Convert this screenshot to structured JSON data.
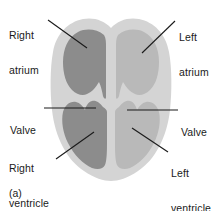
{
  "figure": {
    "caption": "(a)",
    "labels": {
      "right_atrium_line1": "Right",
      "right_atrium_line2": "atrium",
      "left_atrium_line1": "Left",
      "left_atrium_line2": "atrium",
      "valve_left_label": "Valve",
      "valve_right_label": "Valve",
      "right_ventricle_line1": "Right",
      "right_ventricle_line2": "ventricle",
      "left_ventricle_line1": "Left",
      "left_ventricle_line2": "ventricle"
    },
    "colors": {
      "background": "#ffffff",
      "heart_muscle": "#d4d4d4",
      "right_chambers": "#8c8c8c",
      "left_chambers": "#b9b9b9",
      "leader_line": "#1a1a1a",
      "text": "#1a1a1a"
    }
  }
}
